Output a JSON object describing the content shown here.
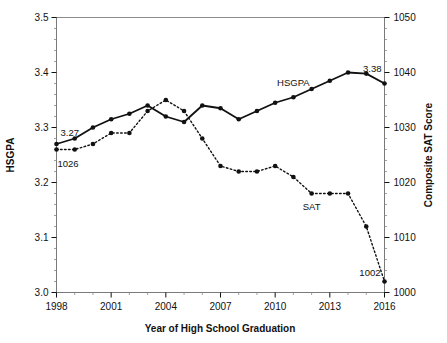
{
  "chart_data": {
    "type": "line",
    "title": "",
    "xlabel": "Year of High School Graduation",
    "ylabel": "HSGPA",
    "y2label": "Composite SAT Score",
    "grid": false,
    "legend_position": "inline-labels",
    "x": [
      1998,
      1999,
      2000,
      2001,
      2002,
      2003,
      2004,
      2005,
      2006,
      2007,
      2008,
      2009,
      2010,
      2011,
      2012,
      2013,
      2014,
      2015,
      2016
    ],
    "xlim": [
      1998,
      2016
    ],
    "xticks": [
      1998,
      2001,
      2004,
      2007,
      2010,
      2013,
      2016
    ],
    "xtick_labels": [
      "1998",
      "2001",
      "2004",
      "2007",
      "2010",
      "2013",
      "2016"
    ],
    "ylim": [
      3.0,
      3.5
    ],
    "yticks": [
      3.0,
      3.1,
      3.2,
      3.3,
      3.4,
      3.5
    ],
    "ytick_labels": [
      "3.0",
      "3.1",
      "3.2",
      "3.3",
      "3.4",
      "3.5"
    ],
    "y2lim": [
      1000,
      1050
    ],
    "y2ticks": [
      1000,
      1010,
      1020,
      1030,
      1040,
      1050
    ],
    "y2tick_labels": [
      "1000",
      "1010",
      "1020",
      "1030",
      "1040",
      "1050"
    ],
    "series": [
      {
        "name": "HSGPA",
        "axis": "left",
        "style": "solid",
        "marker": "filled-circle",
        "color": "#111111",
        "values": [
          3.27,
          3.28,
          3.3,
          3.315,
          3.325,
          3.34,
          3.32,
          3.31,
          3.34,
          3.335,
          3.315,
          3.33,
          3.345,
          3.355,
          3.37,
          3.385,
          3.4,
          3.398,
          3.38
        ]
      },
      {
        "name": "SAT",
        "axis": "right",
        "style": "dotted",
        "marker": "filled-circle",
        "color": "#111111",
        "values": [
          1026,
          1026,
          1027,
          1029,
          1029,
          1033,
          1035,
          1033,
          1028,
          1023,
          1022,
          1022,
          1023,
          1021,
          1018,
          1018,
          1018,
          1012,
          1002
        ]
      }
    ],
    "annotations": [
      {
        "text": "3.27",
        "series": "HSGPA",
        "x": 1998,
        "anchor": "left-top"
      },
      {
        "text": "1026",
        "series": "SAT",
        "x": 1998,
        "anchor": "left-bottom"
      },
      {
        "text": "3.38",
        "series": "HSGPA",
        "x": 2016,
        "anchor": "right-top"
      },
      {
        "text": "1002",
        "series": "SAT",
        "x": 2016,
        "anchor": "right-bottom"
      },
      {
        "text": "HSGPA",
        "series": "HSGPA",
        "x": 2011,
        "anchor": "inline"
      },
      {
        "text": "SAT",
        "series": "SAT",
        "x": 2012,
        "anchor": "inline"
      }
    ]
  }
}
